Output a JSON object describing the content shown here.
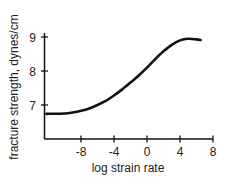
{
  "chart_data": {
    "type": "line",
    "title": "",
    "xlabel": "log strain rate",
    "ylabel": "fracture strength, dynes/cm",
    "xlim": [
      -12.2,
      7.8
    ],
    "ylim": [
      6.0,
      9.1
    ],
    "x_ticks": [
      -8,
      -4,
      0,
      4,
      8
    ],
    "x_tick_labels": [
      "-8",
      "-4",
      "0",
      "4",
      "8"
    ],
    "y_ticks": [
      7,
      8,
      9
    ],
    "y_tick_labels": [
      "7",
      "8",
      "9"
    ],
    "grid": false,
    "legend": null,
    "series": [
      {
        "name": "fracture strength",
        "x": [
          -12.2,
          -10,
          -9,
          -8,
          -7,
          -6,
          -5,
          -4,
          -3,
          -2,
          -1,
          0,
          1,
          2,
          3,
          4,
          5,
          6,
          6.5
        ],
        "y": [
          6.74,
          6.75,
          6.78,
          6.83,
          6.9,
          7.0,
          7.12,
          7.28,
          7.46,
          7.66,
          7.87,
          8.1,
          8.35,
          8.58,
          8.77,
          8.9,
          8.95,
          8.93,
          8.91
        ]
      }
    ]
  }
}
